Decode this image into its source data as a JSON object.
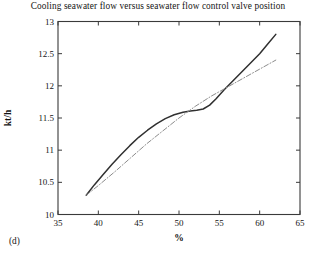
{
  "figure": {
    "subfigure_label": "(d)"
  },
  "chart_data": {
    "type": "line",
    "title": "Cooling seawater flow versus seawater flow control valve position",
    "xlabel": "%",
    "ylabel": "kt/h",
    "xlim": [
      35,
      65
    ],
    "ylim": [
      10,
      13
    ],
    "xticks": [
      35,
      40,
      45,
      50,
      55,
      60,
      65
    ],
    "xticklabels": [
      "35",
      "40",
      "45",
      "50",
      "55",
      "60",
      "65"
    ],
    "yticks": [
      10,
      10.5,
      11,
      11.5,
      12,
      12.5,
      13
    ],
    "yticklabels": [
      "10",
      "10.5",
      "11",
      "11.5",
      "12",
      "12.5",
      "13"
    ],
    "grid": false,
    "legend": "none",
    "series": [
      {
        "name": "measured cooling seawater flow",
        "style": "solid",
        "color": "#303030",
        "x": [
          38.5,
          39.5,
          40.6,
          41.7,
          42.8,
          43.9,
          45.0,
          46.1,
          47.2,
          48.3,
          49.4,
          50.5,
          51.4,
          52.2,
          53.0,
          53.8,
          54.6,
          55.6,
          56.7,
          57.8,
          58.9,
          60.0,
          61.0,
          62.0
        ],
        "y": [
          10.3,
          10.46,
          10.62,
          10.78,
          10.93,
          11.07,
          11.2,
          11.31,
          11.41,
          11.49,
          11.55,
          11.59,
          11.61,
          11.62,
          11.64,
          11.7,
          11.8,
          11.94,
          12.08,
          12.22,
          12.36,
          12.5,
          12.65,
          12.8
        ]
      },
      {
        "name": "linear reference / fitted trend",
        "style": "dashdot",
        "color": "#8c8c8c",
        "x": [
          38.5,
          40.0,
          42.0,
          44.0,
          46.0,
          48.0,
          50.0,
          52.0,
          54.0,
          56.0,
          58.0,
          60.0,
          62.0
        ],
        "y": [
          10.3,
          10.45,
          10.66,
          10.88,
          11.1,
          11.3,
          11.5,
          11.68,
          11.84,
          11.98,
          12.12,
          12.26,
          12.4
        ]
      }
    ]
  }
}
